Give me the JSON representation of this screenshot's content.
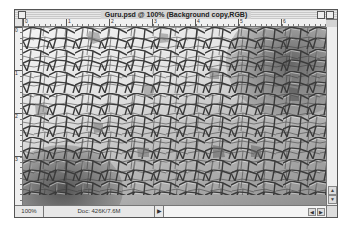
{
  "window": {
    "title": "Guru.psd @ 100% (Background copy,RGB)",
    "icons": {
      "close": "close-box-icon",
      "zoom": "zoom-box-icon",
      "collapse": "collapse-box-icon"
    }
  },
  "rulers": {
    "horizontal_ticks": [
      "0",
      "1",
      "2",
      "3",
      "4",
      "5",
      "6"
    ],
    "vertical_ticks": [
      "0",
      "1",
      "2",
      "3"
    ]
  },
  "canvas": {
    "description": "Stained-glass filtered image: grey polygonal cells with light gradient, darker regions at lower-left and upper-right"
  },
  "status": {
    "zoom": "100%",
    "doc": "Doc: 426K/7.6M",
    "popup_arrow": "▶"
  },
  "scroll": {
    "up": "▲",
    "down": "▼",
    "left": "◀",
    "right": "▶"
  }
}
